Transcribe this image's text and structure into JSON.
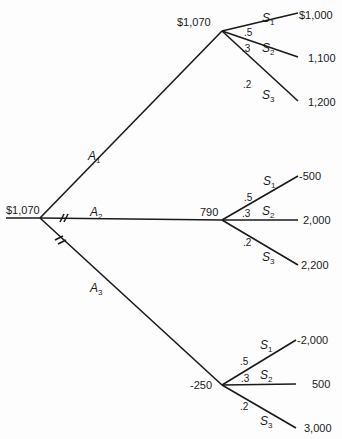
{
  "root": {
    "value": "$1,070"
  },
  "actions": [
    {
      "label": "A",
      "sub": "1",
      "node_value": "$1,070",
      "outcomes": [
        {
          "state": "S",
          "sub": "1",
          "prob": ".5",
          "payoff": "$1,000"
        },
        {
          "state": "S",
          "sub": "2",
          "prob": ".3",
          "payoff": "1,100"
        },
        {
          "state": "S",
          "sub": "3",
          "prob": ".2",
          "payoff": "1,200"
        }
      ]
    },
    {
      "label": "A",
      "sub": "2",
      "node_value": "790",
      "outcomes": [
        {
          "state": "S",
          "sub": "1",
          "prob": ".5",
          "payoff": "-500"
        },
        {
          "state": "S",
          "sub": "2",
          "prob": ".3",
          "payoff": "2,000"
        },
        {
          "state": "S",
          "sub": "3",
          "prob": ".2",
          "payoff": "2,200"
        }
      ]
    },
    {
      "label": "A",
      "sub": "3",
      "node_value": "-250",
      "outcomes": [
        {
          "state": "S",
          "sub": "1",
          "prob": ".5",
          "payoff": "-2,000"
        },
        {
          "state": "S",
          "sub": "2",
          "prob": ".3",
          "payoff": "500"
        },
        {
          "state": "S",
          "sub": "3",
          "prob": ".2",
          "payoff": "3,000"
        }
      ]
    }
  ]
}
